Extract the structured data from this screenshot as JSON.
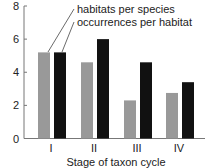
{
  "chart_data": {
    "type": "bar",
    "title": "",
    "xlabel": "Stage of taxon cycle",
    "ylabel": "",
    "ylim": [
      0,
      8
    ],
    "yticks": [
      0,
      2,
      4,
      6,
      8
    ],
    "categories": [
      "I",
      "II",
      "III",
      "IV"
    ],
    "series": [
      {
        "name": "habitats per species",
        "color": "#999999",
        "values": [
          5.2,
          4.6,
          2.3,
          2.75
        ]
      },
      {
        "name": "occurrences per habitat",
        "color": "#111111",
        "values": [
          5.2,
          6.0,
          4.6,
          3.4
        ]
      }
    ],
    "legend_position": "top, with leader lines to stage I bars",
    "grid": false
  }
}
